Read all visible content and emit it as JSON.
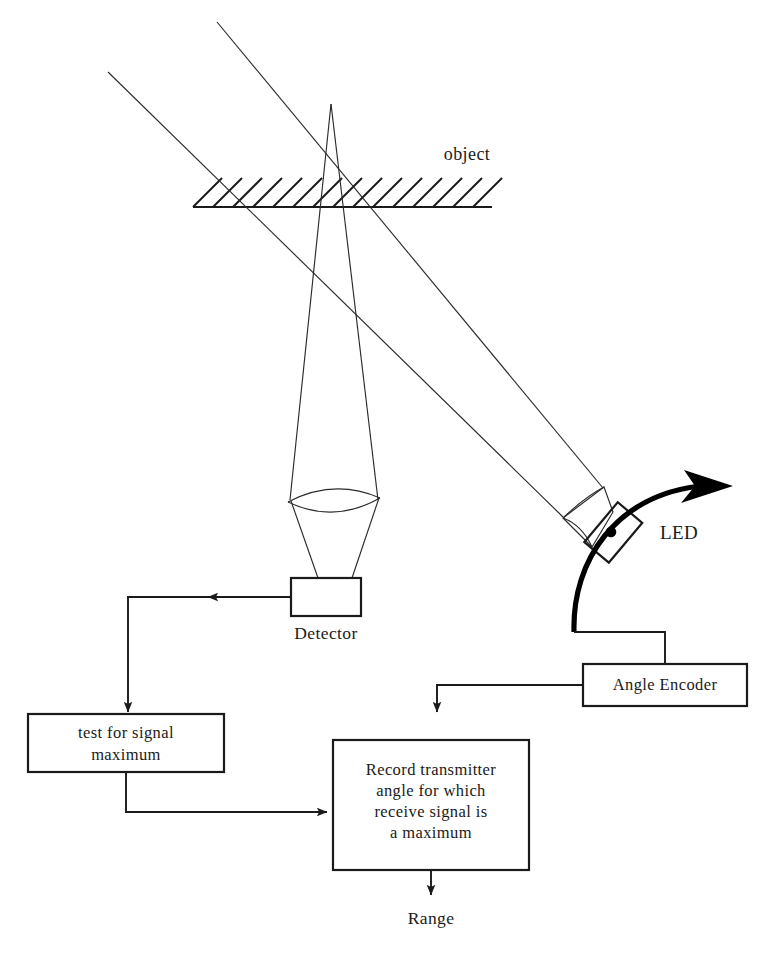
{
  "figure": {
    "background_color": "#ffffff",
    "ink_color": "#1a1a1a"
  },
  "scene_labels": {
    "object": "object",
    "led": "LED",
    "detector": "Detector"
  },
  "blocks": [
    {
      "id": "detector",
      "label": "Detector",
      "lines": [
        "Detector"
      ]
    },
    {
      "id": "angle-encoder",
      "label": "Angle Encoder",
      "lines": [
        "Angle Encoder"
      ]
    },
    {
      "id": "test-for-signal-maximum",
      "label": "test for signal maximum",
      "lines": [
        "test for signal",
        "maximum"
      ]
    },
    {
      "id": "record-transmitter-angle",
      "label": "Record transmitter angle for which receive signal is a maximum",
      "lines": [
        "Record transmitter",
        "angle for which",
        "receive signal is",
        "a maximum"
      ]
    }
  ],
  "block_text": {
    "test_line1": "test for signal",
    "test_line2": "maximum",
    "record_line1": "Record transmitter",
    "record_line2": "angle for which",
    "record_line3": "receive signal is",
    "record_line4": "a maximum",
    "angle_encoder": "Angle Encoder"
  },
  "outputs": {
    "range": "Range"
  },
  "components": {
    "led_source": "LED",
    "led_lens": "transmit-lens",
    "detector_lens": "receive-lens",
    "detector_box": "Detector",
    "rotation_arrow": "scan-rotation-arrow",
    "object_surface": "hatched-object-surface"
  },
  "flow_arrows": [
    {
      "from": "detector",
      "to": "test-for-signal-maximum"
    },
    {
      "from": "test-for-signal-maximum",
      "to": "record-transmitter-angle"
    },
    {
      "from": "angle-encoder",
      "to": "record-transmitter-angle"
    },
    {
      "from": "record-transmitter-angle",
      "to": "range"
    }
  ]
}
